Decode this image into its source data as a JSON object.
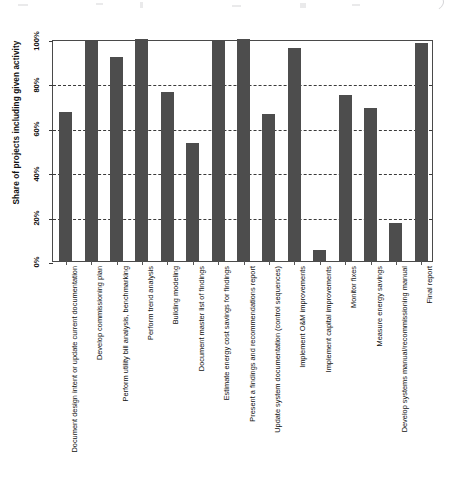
{
  "chart_data": {
    "type": "bar",
    "title": "",
    "subtitle": "",
    "xlabel": "",
    "ylabel": "Share of projects including given activity",
    "ylim": [
      0,
      100
    ],
    "ytick_labels": [
      "0%",
      "20%",
      "40%",
      "60%",
      "80%",
      "100%"
    ],
    "ytick_values": [
      0,
      20,
      40,
      60,
      80,
      100
    ],
    "grid": true,
    "grid_style": "dashed horizontal",
    "legend": null,
    "orientation": "vertical",
    "bar_color": "#4d4d4d",
    "categories": [
      "Document design intent or update current documentation",
      "Develop commissioning plan",
      "Perform utility bill analysis, benchmarking",
      "Perform trend analysis",
      "Building modeling",
      "Document master list of findings",
      "Estimate energy cost savings for findings",
      "Present a findings and recommendations report",
      "Update system documentation (control sequences)",
      "Implement O&M improvements",
      "Implement capital improvements",
      "Monitor fixes",
      "Measure energy savings",
      "Develop systems manual/recommissioning manual",
      "Final report"
    ],
    "values": [
      67,
      99,
      92,
      100,
      76,
      53,
      99,
      100,
      66,
      96,
      5,
      75,
      69,
      17,
      98
    ]
  },
  "axis": {
    "y_title": "Share of projects including given activity"
  }
}
